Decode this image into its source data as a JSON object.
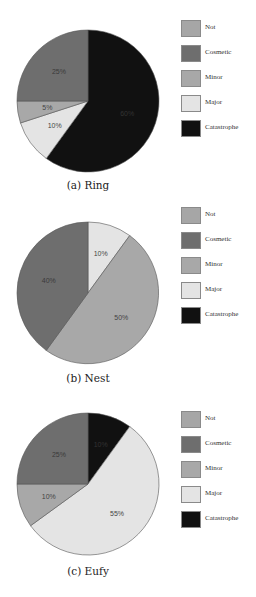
{
  "chart_data": [
    {
      "type": "pie",
      "title": "(a) Ring",
      "caption": "(a) Ring",
      "categories": [
        "Not",
        "Cosmetic",
        "Minor",
        "Major",
        "Catastrophe"
      ],
      "values": [
        0,
        25,
        5,
        10,
        60
      ],
      "labels": [
        "",
        "25%",
        "5%",
        "10%",
        "60%"
      ],
      "legend_position": "right"
    },
    {
      "type": "pie",
      "title": "(b) Nest",
      "caption": "(b) Nest",
      "categories": [
        "Not",
        "Cosmetic",
        "Minor",
        "Major",
        "Catastrophe"
      ],
      "values": [
        0,
        40,
        50,
        10,
        0
      ],
      "labels": [
        "",
        "40%",
        "50%",
        "10%",
        ""
      ],
      "legend_position": "right"
    },
    {
      "type": "pie",
      "title": "(c) Eufy",
      "caption": "(c) Eufy",
      "categories": [
        "Not",
        "Cosmetic",
        "Minor",
        "Major",
        "Catastrophe"
      ],
      "values": [
        0,
        25,
        10,
        55,
        10
      ],
      "labels": [
        "",
        "25%",
        "10%",
        "55%",
        "10%"
      ],
      "legend_position": "right"
    }
  ],
  "legend": {
    "items": [
      {
        "label": "Not",
        "color": "#a6a6a6"
      },
      {
        "label": "Cosmetic",
        "color": "#6e6e6e"
      },
      {
        "label": "Minor",
        "color": "#a8a8a8"
      },
      {
        "label": "Major",
        "color": "#e4e4e4"
      },
      {
        "label": "Catastrophe",
        "color": "#111111"
      }
    ]
  },
  "captions": {
    "a": "(a) Ring",
    "b": "(b) Nest",
    "c": "(c) Eufy"
  }
}
